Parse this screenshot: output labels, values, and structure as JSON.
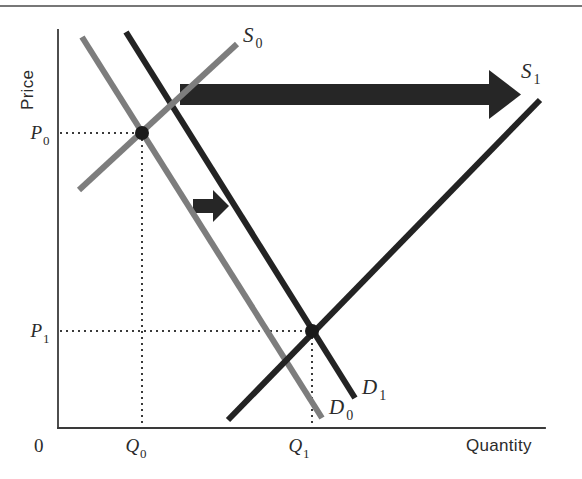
{
  "figure": {
    "background_color": "#ffffff",
    "top_rule_color": "#4a4a4a"
  },
  "axes": {
    "y_label": "Price",
    "x_label": "Quantity",
    "origin_label": "0",
    "axis_color": "#3a3a3a",
    "x_axis_y": 428,
    "y_axis_x": 58,
    "x_axis_end": 545,
    "y_axis_top": 30
  },
  "price_ticks": [
    {
      "label": "P",
      "sub": "0",
      "y": 133
    },
    {
      "label": "P",
      "sub": "1",
      "y": 331
    }
  ],
  "quantity_ticks": [
    {
      "label": "Q",
      "sub": "0",
      "x": 142
    },
    {
      "label": "Q",
      "sub": "1",
      "x": 305
    }
  ],
  "curves": [
    {
      "name": "demand-initial",
      "label": "D",
      "sub": "0",
      "color": "#7d7d7d",
      "width": 6,
      "x1": 82,
      "y1": 37,
      "x2": 322,
      "y2": 418,
      "label_x": 329,
      "label_y": 414
    },
    {
      "name": "demand-shifted",
      "label": "D",
      "sub": "1",
      "color": "#232323",
      "width": 6,
      "x1": 126,
      "y1": 32,
      "x2": 355,
      "y2": 398,
      "label_x": 362,
      "label_y": 394
    },
    {
      "name": "supply-initial",
      "label": "S",
      "sub": "0",
      "color": "#7d7d7d",
      "width": 6,
      "x1": 79,
      "y1": 190,
      "x2": 237,
      "y2": 44,
      "label_x": 243,
      "label_y": 42
    },
    {
      "name": "supply-shifted",
      "label": "S",
      "sub": "1",
      "color": "#232323",
      "width": 6,
      "x1": 228,
      "y1": 420,
      "x2": 540,
      "y2": 100,
      "label_x": 521,
      "label_y": 78
    }
  ],
  "equilibria": [
    {
      "name": "equilibrium-initial",
      "x": 142,
      "y": 133,
      "r": 7,
      "color": "#1a1a1a"
    },
    {
      "name": "equilibrium-final",
      "x": 312,
      "y": 331,
      "r": 7,
      "color": "#1a1a1a"
    }
  ],
  "guide_lines": {
    "color": "#3a3a3a",
    "dash": "2 4",
    "width": 2,
    "segments": [
      {
        "name": "p0-horizontal",
        "x1": 60,
        "y1": 133,
        "x2": 142,
        "y2": 133
      },
      {
        "name": "q0-vertical",
        "x1": 142,
        "y1": 133,
        "x2": 142,
        "y2": 428
      },
      {
        "name": "p1-horizontal",
        "x1": 60,
        "y1": 331,
        "x2": 312,
        "y2": 331
      },
      {
        "name": "q1-vertical",
        "x1": 312,
        "y1": 331,
        "x2": 312,
        "y2": 428
      }
    ]
  },
  "arrows": [
    {
      "name": "supply-shift-arrow",
      "color": "#262626",
      "x_start": 180,
      "x_tip": 521,
      "shaft_top": 84,
      "shaft_bottom": 105,
      "head_start": 489,
      "head_top": 70,
      "head_bottom": 119
    },
    {
      "name": "demand-shift-arrow",
      "color": "#262626",
      "x_start": 193,
      "x_tip": 229,
      "shaft_top": 199,
      "shaft_bottom": 213,
      "head_start": 213,
      "head_top": 190,
      "head_bottom": 222
    }
  ],
  "chart_data": {
    "type": "line",
    "xlabel": "Quantity",
    "ylabel": "Price",
    "grid": false,
    "legend": "inline-curve-labels",
    "series": [
      {
        "name": "D0",
        "role": "demand",
        "slope": "negative",
        "color": "#7d7d7d"
      },
      {
        "name": "D1",
        "role": "demand",
        "slope": "negative",
        "color": "#232323",
        "shift": "right"
      },
      {
        "name": "S0",
        "role": "supply",
        "slope": "positive",
        "color": "#7d7d7d"
      },
      {
        "name": "S1",
        "role": "supply",
        "slope": "positive",
        "color": "#232323",
        "shift": "right"
      }
    ],
    "equilibrium_points": [
      {
        "name": "E0",
        "price": "P0",
        "quantity": "Q0"
      },
      {
        "name": "E1",
        "price": "P1",
        "quantity": "Q1"
      }
    ],
    "annotations": [
      "Large rightward arrow indicating supply curve shift from S0 to S1",
      "Small rightward arrow indicating demand curve shift from D0 to D1"
    ]
  }
}
